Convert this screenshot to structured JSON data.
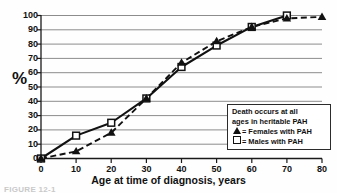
{
  "chart_data": {
    "type": "line",
    "title": "",
    "xlabel": "Age at time of diagnosis, years",
    "ylabel": "%",
    "xlim": [
      0,
      80
    ],
    "ylim": [
      0,
      100
    ],
    "xticks": [
      0,
      10,
      20,
      30,
      40,
      50,
      60,
      70,
      80
    ],
    "yticks": [
      0,
      10,
      20,
      30,
      40,
      50,
      60,
      70,
      80,
      90,
      100
    ],
    "grid": "horizontal",
    "legend_position": "lower-right",
    "legend_title": [
      "Death occurs at all",
      "ages in heritable PAH"
    ],
    "series": [
      {
        "name": "Females with PAH",
        "marker": "filled-triangle",
        "line_style": "dashed",
        "color": "#111111",
        "x": [
          0,
          10,
          20,
          30,
          40,
          50,
          60,
          70,
          80
        ],
        "values": [
          0,
          5,
          18,
          42,
          67,
          82,
          92,
          98,
          99
        ]
      },
      {
        "name": "Males with PAH",
        "marker": "open-square",
        "line_style": "solid",
        "color": "#111111",
        "x": [
          0,
          10,
          20,
          30,
          40,
          50,
          60,
          70
        ],
        "values": [
          0,
          16,
          25,
          42,
          64,
          79,
          92,
          100
        ]
      }
    ]
  },
  "axis": {
    "y_title": "%",
    "x_title": "Age at time of diagnosis, years",
    "y_tick_labels": [
      "100",
      "90",
      "80",
      "70",
      "60",
      "50",
      "40",
      "30",
      "20",
      "10",
      "0"
    ],
    "x_tick_labels": [
      "0",
      "10",
      "20",
      "30",
      "40",
      "50",
      "60",
      "70",
      "80"
    ]
  },
  "legend": {
    "line1": "Death occurs at all",
    "line2": "ages in heritable PAH",
    "females_label": "= Females with PAH",
    "males_label": "= Males with PAH"
  },
  "caption": {
    "text": "FIGURE 12-1"
  },
  "colors": {
    "ink": "#111111",
    "gridline": "#8c8c8c",
    "background": "#fefefe"
  }
}
